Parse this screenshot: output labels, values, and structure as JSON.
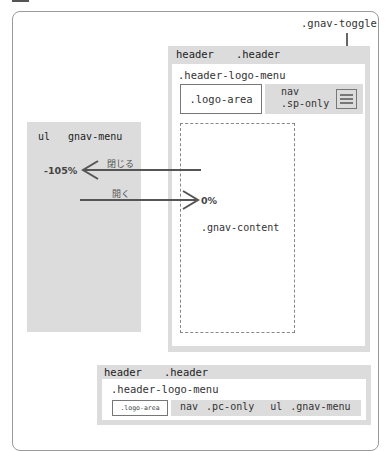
{
  "diagram": {
    "toggle_label": ".gnav-toggle",
    "sp_header": {
      "tag": "header",
      "class": ".header",
      "logo_menu_label": ".header-logo-menu",
      "logo_area_label": ".logo-area",
      "nav_tag": "nav",
      "nav_class": ".sp-only",
      "toggle_icon": "hamburger-icon"
    },
    "gnav_content_label": ".gnav-content",
    "gnav_menu": {
      "tag": "ul",
      "class": "gnav-menu"
    },
    "transitions": {
      "close_label": "閉じる",
      "close_value": "-105%",
      "open_label": "開く",
      "open_value": "0%"
    },
    "pc_header": {
      "tag": "header",
      "class": ".header",
      "logo_menu_label": ".header-logo-menu",
      "logo_area_label": ".logo-area",
      "nav_tag": "nav",
      "nav_class": ".pc-only",
      "ul_tag": "ul",
      "ul_class": ".gnav-menu"
    },
    "colors": {
      "block_gray": "#dcdcdc",
      "line_dark": "#555555",
      "border": "#777777"
    }
  }
}
